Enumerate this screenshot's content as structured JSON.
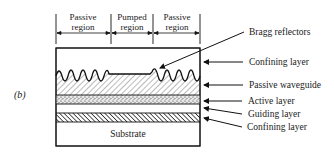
{
  "figure": {
    "label": "(b)",
    "regions": [
      {
        "line1": "Passive",
        "line2": "region"
      },
      {
        "line1": "Pumped",
        "line2": "region"
      },
      {
        "line1": "Passive",
        "line2": "region"
      }
    ],
    "layers": [
      {
        "name": "Bragg reflectors"
      },
      {
        "name": "Confining layer"
      },
      {
        "name": "Passive waveguide"
      },
      {
        "name": "Active layer"
      },
      {
        "name": "Guiding layer"
      },
      {
        "name": "Confining layer"
      }
    ],
    "substrate_label": "Substrate"
  }
}
